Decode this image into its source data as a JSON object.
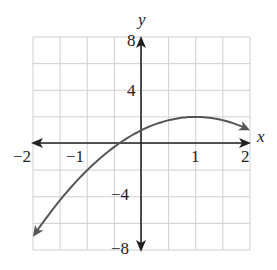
{
  "chart_data": {
    "type": "line",
    "title": "",
    "xlabel": "x",
    "ylabel": "y",
    "xlim": [
      -2,
      2
    ],
    "ylim": [
      -8,
      8
    ],
    "grid": true,
    "x_grid_step": 0.5,
    "y_grid_step": 2,
    "x_ticks": [
      -2,
      -1,
      1,
      2
    ],
    "x_tick_labels": [
      "−2",
      "−1",
      "1",
      "2"
    ],
    "y_ticks": [
      8,
      4,
      -4,
      -8
    ],
    "y_tick_labels": [
      "8",
      "4",
      "−4",
      "−8"
    ],
    "series": [
      {
        "name": "y = -x^2 + 2x + 1",
        "x": [
          -2,
          -1.5,
          -1,
          -0.5,
          0,
          0.5,
          1,
          1.5,
          2
        ],
        "y": [
          -7,
          -4.25,
          -2,
          -0.25,
          1,
          1.75,
          2,
          1.75,
          1
        ],
        "arrows_at_ends": true
      }
    ],
    "colors": {
      "curve": "#555555",
      "axes": "#222222",
      "grid": "#cfcfcf"
    }
  }
}
